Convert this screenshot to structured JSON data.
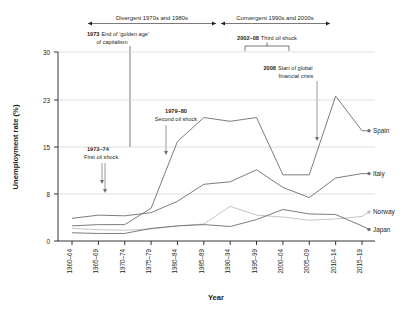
{
  "chart_data": {
    "type": "line",
    "title": "",
    "xlabel": "Year",
    "ylabel": "Unemployment rate (%)",
    "categories": [
      "1960–64",
      "1965–69",
      "1970–74",
      "1975–79",
      "1980–84",
      "1985–89",
      "1990–94",
      "1995–99",
      "2000–04",
      "2005–09",
      "2010–14",
      "2015–19"
    ],
    "ylim": [
      0,
      30
    ],
    "yticks": [
      0,
      8,
      15,
      23,
      30
    ],
    "grid": true,
    "legend_position": "right-inline",
    "series": [
      {
        "name": "Spain",
        "values": [
          2.4,
          2.6,
          2.6,
          5.2,
          15.8,
          19.6,
          19.0,
          19.6,
          10.5,
          10.5,
          23.0,
          17.5
        ]
      },
      {
        "name": "Italy",
        "values": [
          3.6,
          4.1,
          4.0,
          4.5,
          6.3,
          9.0,
          9.4,
          11.3,
          8.5,
          6.9,
          10.0,
          10.7
        ]
      },
      {
        "name": "Norway",
        "values": [
          2.0,
          1.8,
          1.7,
          1.9,
          2.4,
          2.7,
          5.5,
          4.1,
          3.8,
          3.3,
          3.5,
          3.9
        ]
      },
      {
        "name": "Japan",
        "values": [
          1.3,
          1.2,
          1.2,
          2.0,
          2.4,
          2.6,
          2.3,
          3.4,
          5.0,
          4.3,
          4.2,
          2.4
        ]
      }
    ]
  },
  "periods": [
    {
      "label": "Divergent 1970s and 1980s"
    },
    {
      "label": "Convergent 1990s and 2000s"
    }
  ],
  "annotations": [
    {
      "id": "golden-age",
      "bold": "1973",
      "line1": "End of 'golden age'",
      "line2": "of capitalism"
    },
    {
      "id": "third-oil-shock",
      "bold": "2002–08",
      "line1": "Third oil shock",
      "line2": ""
    },
    {
      "id": "financial-crisis",
      "bold": "2008",
      "line1": "Start of global",
      "line2": "financial crisis"
    },
    {
      "id": "second-oil-shock",
      "bold": "1979–80",
      "line1": "Second oil shock",
      "line2": ""
    },
    {
      "id": "first-oil-shock",
      "bold": "1973–74",
      "line1": "First oil shock",
      "line2": ""
    }
  ],
  "colors": {
    "line": "#6d6e71",
    "axis": "#231f20",
    "grid": "#c9cacc",
    "norway": "#bcbec0",
    "text": "#231f20"
  }
}
